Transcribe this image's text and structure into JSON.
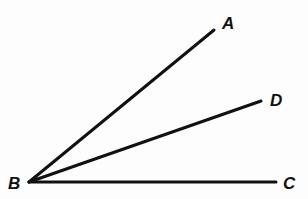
{
  "diagram": {
    "type": "geometry-angles",
    "colors": {
      "stroke": "#111111",
      "background": "#fdfdfd"
    },
    "vertex": {
      "id": "B",
      "label": "B",
      "x": 29,
      "y": 182,
      "label_x": 8,
      "label_y": 189
    },
    "rays": [
      {
        "id": "BA",
        "from": "B",
        "to": "A",
        "label": "A",
        "x2": 214,
        "y2": 30,
        "label_x": 222,
        "label_y": 29
      },
      {
        "id": "BD",
        "from": "B",
        "to": "D",
        "label": "D",
        "x2": 261,
        "y2": 101,
        "label_x": 270,
        "label_y": 106
      },
      {
        "id": "BC",
        "from": "B",
        "to": "C",
        "label": "C",
        "x2": 276,
        "y2": 182,
        "label_x": 283,
        "label_y": 189
      }
    ]
  }
}
